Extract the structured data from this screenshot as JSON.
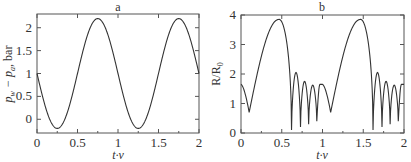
{
  "chart_data": [
    {
      "type": "line",
      "title": "a",
      "xlabel": "t·v",
      "ylabel": "p_w − p_a, bar",
      "xlim": [
        0,
        2
      ],
      "ylim": [
        -0.3,
        2.3
      ],
      "xticks": [
        "0",
        "0.5",
        "1",
        "1.5",
        "2"
      ],
      "yticks": [
        "0",
        "0.5",
        "1",
        "1.5",
        "2"
      ],
      "grid": false,
      "series": [
        {
          "name": "pressure difference",
          "x": [
            0,
            0.125,
            0.25,
            0.375,
            0.5,
            0.625,
            0.75,
            0.875,
            1.0,
            1.125,
            1.25,
            1.375,
            1.5,
            1.625,
            1.75,
            1.875,
            2.0
          ],
          "values": [
            1.0,
            0.15,
            -0.2,
            0.15,
            1.0,
            1.85,
            2.2,
            1.85,
            1.0,
            0.15,
            -0.2,
            0.15,
            1.0,
            1.85,
            2.2,
            1.85,
            1.0
          ]
        }
      ]
    },
    {
      "type": "line",
      "title": "b",
      "xlabel": "t·v",
      "ylabel": "R/R₀",
      "xlim": [
        0,
        2
      ],
      "ylim": [
        0,
        4
      ],
      "xticks": [
        "0",
        "0.5",
        "1",
        "1.5",
        "2"
      ],
      "yticks": [
        "0",
        "1",
        "2",
        "3",
        "4"
      ],
      "grid": false,
      "series": [
        {
          "name": "bubble radius",
          "x": [
            0,
            0.04,
            0.1,
            0.2,
            0.3,
            0.4,
            0.46,
            0.52,
            0.57,
            0.62,
            0.68,
            0.74,
            0.79,
            0.84,
            0.88,
            0.94,
            0.98,
            1.04,
            1.1,
            1.2,
            1.3,
            1.4,
            1.46,
            1.52,
            1.57,
            1.62,
            1.68,
            1.74,
            1.79,
            1.84,
            1.88,
            1.94,
            1.98,
            2.0
          ],
          "values": [
            1.65,
            1.5,
            0.7,
            2.0,
            2.9,
            3.6,
            3.85,
            3.6,
            2.6,
            0.1,
            2.05,
            0.2,
            1.75,
            0.3,
            1.65,
            0.4,
            1.65,
            1.5,
            0.7,
            2.0,
            2.9,
            3.6,
            3.85,
            3.6,
            2.6,
            0.1,
            2.05,
            0.2,
            1.75,
            0.3,
            1.65,
            0.4,
            1.65,
            1.6
          ]
        }
      ]
    }
  ],
  "panels": {
    "a": {
      "title": "a",
      "xlabel": "t·v",
      "ylabel_main": "p",
      "ylabel_sub1": "w",
      "ylabel_mid": " − p",
      "ylabel_sub2": "a",
      "ylabel_unit": ", bar"
    },
    "b": {
      "title": "b",
      "xlabel": "t·v",
      "ylabel": "R/R",
      "ylabel_sub": "0"
    }
  }
}
